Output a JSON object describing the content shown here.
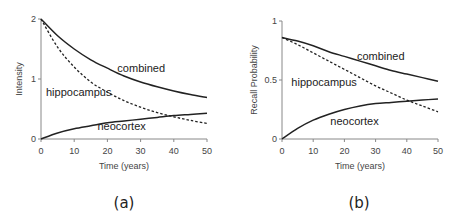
{
  "chart_data": [
    {
      "type": "line",
      "panel_label": "(a)",
      "xlabel": "Time (years)",
      "ylabel": "Intensity",
      "xlim": [
        0,
        50
      ],
      "ylim": [
        0,
        2
      ],
      "xticks": [
        0,
        10,
        20,
        30,
        40,
        50
      ],
      "yticks": [
        0,
        1,
        2
      ],
      "ytick_labels": [
        "0",
        "1",
        "2"
      ],
      "x": [
        0,
        5,
        10,
        15,
        20,
        25,
        30,
        35,
        40,
        45,
        50
      ],
      "series": [
        {
          "name": "combined",
          "style": "solid",
          "values": [
            2.0,
            1.72,
            1.5,
            1.32,
            1.18,
            1.05,
            0.95,
            0.87,
            0.8,
            0.74,
            0.69
          ]
        },
        {
          "name": "hippocampus",
          "style": "dashed",
          "values": [
            2.0,
            1.53,
            1.2,
            0.95,
            0.78,
            0.64,
            0.53,
            0.44,
            0.37,
            0.31,
            0.26
          ]
        },
        {
          "name": "neocortex",
          "style": "solid",
          "values": [
            0.0,
            0.1,
            0.17,
            0.22,
            0.27,
            0.3,
            0.33,
            0.36,
            0.39,
            0.41,
            0.43
          ]
        }
      ],
      "annotations": [
        {
          "text": "combined",
          "x": 23,
          "y": 1.19
        },
        {
          "text": "hippocampus",
          "x": 1.5,
          "y": 0.78
        },
        {
          "text": "neocortex",
          "x": 17,
          "y": 0.22
        }
      ]
    },
    {
      "type": "line",
      "panel_label": "(b)",
      "xlabel": "Time (years)",
      "ylabel": "Recall Probability",
      "xlim": [
        0,
        50
      ],
      "ylim": [
        0,
        1
      ],
      "xticks": [
        0,
        10,
        20,
        30,
        40,
        50
      ],
      "yticks": [
        0,
        0.5,
        1
      ],
      "ytick_labels": [
        "0",
        "0.5",
        "1"
      ],
      "x": [
        0,
        5,
        10,
        15,
        20,
        25,
        30,
        35,
        40,
        45,
        50
      ],
      "series": [
        {
          "name": "combined",
          "style": "solid",
          "values": [
            0.86,
            0.83,
            0.79,
            0.74,
            0.7,
            0.66,
            0.62,
            0.58,
            0.55,
            0.52,
            0.49
          ]
        },
        {
          "name": "hippocampus",
          "style": "dashed",
          "values": [
            0.86,
            0.8,
            0.73,
            0.66,
            0.59,
            0.52,
            0.45,
            0.39,
            0.33,
            0.28,
            0.23
          ]
        },
        {
          "name": "neocortex",
          "style": "solid",
          "values": [
            0.0,
            0.09,
            0.16,
            0.21,
            0.25,
            0.28,
            0.3,
            0.31,
            0.32,
            0.33,
            0.34
          ]
        }
      ],
      "annotations": [
        {
          "text": "combined",
          "x": 24,
          "y": 0.7
        },
        {
          "text": "hippocampus",
          "x": 3,
          "y": 0.48
        },
        {
          "text": "neocortex",
          "x": 15.5,
          "y": 0.15
        }
      ]
    }
  ]
}
